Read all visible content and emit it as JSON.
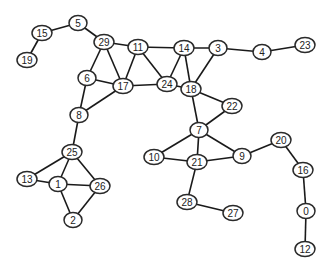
{
  "graph": {
    "node_style": {
      "fill": "#ffffff",
      "stroke": "#2a2a2a",
      "label_color": "#222222"
    },
    "edge_color": "#1a1a1a",
    "nodes": [
      {
        "id": "0",
        "x": 306,
        "y": 211
      },
      {
        "id": "1",
        "x": 58,
        "y": 184
      },
      {
        "id": "2",
        "x": 73,
        "y": 220
      },
      {
        "id": "3",
        "x": 218,
        "y": 48
      },
      {
        "id": "4",
        "x": 262,
        "y": 52
      },
      {
        "id": "5",
        "x": 78,
        "y": 23
      },
      {
        "id": "6",
        "x": 87,
        "y": 78
      },
      {
        "id": "7",
        "x": 199,
        "y": 130
      },
      {
        "id": "8",
        "x": 79,
        "y": 115
      },
      {
        "id": "9",
        "x": 242,
        "y": 156
      },
      {
        "id": "10",
        "x": 154,
        "y": 157
      },
      {
        "id": "11",
        "x": 138,
        "y": 47
      },
      {
        "id": "12",
        "x": 305,
        "y": 249
      },
      {
        "id": "13",
        "x": 27,
        "y": 179
      },
      {
        "id": "14",
        "x": 184,
        "y": 48
      },
      {
        "id": "15",
        "x": 42,
        "y": 33
      },
      {
        "id": "16",
        "x": 303,
        "y": 170
      },
      {
        "id": "17",
        "x": 123,
        "y": 86
      },
      {
        "id": "18",
        "x": 191,
        "y": 89
      },
      {
        "id": "19",
        "x": 27,
        "y": 60
      },
      {
        "id": "20",
        "x": 281,
        "y": 140
      },
      {
        "id": "21",
        "x": 197,
        "y": 162
      },
      {
        "id": "22",
        "x": 232,
        "y": 106
      },
      {
        "id": "23",
        "x": 305,
        "y": 45
      },
      {
        "id": "24",
        "x": 167,
        "y": 84
      },
      {
        "id": "25",
        "x": 72,
        "y": 152
      },
      {
        "id": "26",
        "x": 100,
        "y": 186
      },
      {
        "id": "27",
        "x": 233,
        "y": 213
      },
      {
        "id": "28",
        "x": 187,
        "y": 202
      },
      {
        "id": "29",
        "x": 104,
        "y": 42
      }
    ],
    "edges": [
      [
        "15",
        "5"
      ],
      [
        "15",
        "19"
      ],
      [
        "5",
        "29"
      ],
      [
        "29",
        "11"
      ],
      [
        "29",
        "6"
      ],
      [
        "29",
        "17"
      ],
      [
        "11",
        "17"
      ],
      [
        "11",
        "24"
      ],
      [
        "11",
        "14"
      ],
      [
        "14",
        "24"
      ],
      [
        "14",
        "18"
      ],
      [
        "14",
        "3"
      ],
      [
        "3",
        "18"
      ],
      [
        "3",
        "4"
      ],
      [
        "4",
        "23"
      ],
      [
        "6",
        "17"
      ],
      [
        "6",
        "8"
      ],
      [
        "17",
        "8"
      ],
      [
        "17",
        "24"
      ],
      [
        "24",
        "18"
      ],
      [
        "18",
        "22"
      ],
      [
        "18",
        "7"
      ],
      [
        "22",
        "7"
      ],
      [
        "7",
        "10"
      ],
      [
        "7",
        "21"
      ],
      [
        "7",
        "9"
      ],
      [
        "10",
        "21"
      ],
      [
        "21",
        "9"
      ],
      [
        "21",
        "28"
      ],
      [
        "28",
        "27"
      ],
      [
        "9",
        "20"
      ],
      [
        "20",
        "16"
      ],
      [
        "16",
        "0"
      ],
      [
        "0",
        "12"
      ],
      [
        "8",
        "25"
      ],
      [
        "25",
        "13"
      ],
      [
        "25",
        "1"
      ],
      [
        "25",
        "26"
      ],
      [
        "13",
        "1"
      ],
      [
        "1",
        "26"
      ],
      [
        "1",
        "2"
      ],
      [
        "26",
        "2"
      ]
    ]
  }
}
